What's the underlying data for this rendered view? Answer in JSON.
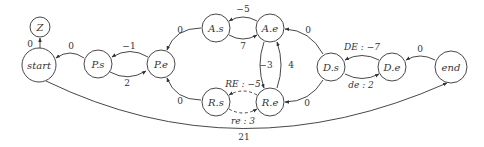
{
  "diagram": {
    "type": "weighted directed graph",
    "nodes": {
      "Z": {
        "label": "Z"
      },
      "start": {
        "label": "start"
      },
      "Ps": {
        "label": "P.s"
      },
      "Pe": {
        "label": "P.e"
      },
      "As": {
        "label": "A.s"
      },
      "Ae": {
        "label": "A.e"
      },
      "Rs": {
        "label": "R.s"
      },
      "Re": {
        "label": "R.e"
      },
      "Ds": {
        "label": "D.s"
      },
      "De": {
        "label": "D.e"
      },
      "end": {
        "label": "end"
      }
    },
    "edges": {
      "start_Z": {
        "from": "start",
        "to": "Z",
        "label": "0",
        "style": "solid"
      },
      "Ps_start": {
        "from": "P.s",
        "to": "start",
        "label": "0",
        "style": "solid"
      },
      "Pe_Ps": {
        "from": "P.e",
        "to": "P.s",
        "label": "−1",
        "style": "solid"
      },
      "Ps_Pe": {
        "from": "P.s",
        "to": "P.e",
        "label": "2",
        "style": "solid"
      },
      "As_Pe": {
        "from": "A.s",
        "to": "P.e",
        "label": "0",
        "style": "solid"
      },
      "Rs_Pe": {
        "from": "R.s",
        "to": "P.e",
        "label": "0",
        "style": "solid"
      },
      "Ae_As": {
        "from": "A.e",
        "to": "A.s",
        "label": "−5",
        "style": "solid"
      },
      "As_Ae": {
        "from": "A.s",
        "to": "A.e",
        "label": "7",
        "style": "solid"
      },
      "Ae_Re": {
        "from": "A.e",
        "to": "R.e",
        "label": "−3",
        "style": "solid"
      },
      "Re_Ae": {
        "from": "R.e",
        "to": "A.e",
        "label": "4",
        "style": "solid"
      },
      "Re_Rs": {
        "from": "R.e",
        "to": "R.s",
        "label": "RE : −5",
        "style": "dashed"
      },
      "Rs_Re": {
        "from": "R.s",
        "to": "R.e",
        "label": "re : 3",
        "style": "dashed"
      },
      "Ds_Ae": {
        "from": "D.s",
        "to": "A.e",
        "label": "0",
        "style": "solid"
      },
      "Ds_Re": {
        "from": "D.s",
        "to": "R.e",
        "label": "0",
        "style": "solid"
      },
      "De_Ds": {
        "from": "D.e",
        "to": "D.s",
        "label": "DE : −7",
        "style": "solid"
      },
      "Ds_De": {
        "from": "D.s",
        "to": "D.e",
        "label": "de : 2",
        "style": "solid"
      },
      "end_De": {
        "from": "end",
        "to": "D.e",
        "label": "0",
        "style": "solid"
      },
      "start_end": {
        "from": "start",
        "to": "end",
        "label": "21",
        "style": "solid"
      }
    }
  }
}
